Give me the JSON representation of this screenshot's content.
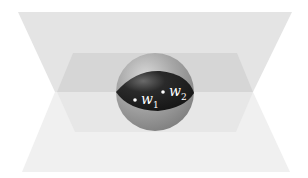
{
  "diagram": {
    "points": [
      {
        "id": "w1",
        "label": "w",
        "subscript": "1"
      },
      {
        "id": "w2",
        "label": "w",
        "subscript": "2"
      }
    ],
    "colors": {
      "plane_top": "#e2e2e2",
      "plane_bottom": "#efefef",
      "plane_mid_dark": "#d4d4d4",
      "plane_mid_light": "#e6e6e6",
      "sphere": "#9a9a9a",
      "lens": "#1e1e1e",
      "point": "#ffffff"
    }
  }
}
